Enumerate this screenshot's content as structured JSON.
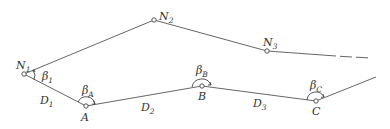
{
  "diagram": {
    "title": "",
    "points": {
      "N1": {
        "label": "N",
        "sub": "1",
        "x": 24,
        "y": 74
      },
      "N2": {
        "label": "N",
        "sub": "2",
        "x": 154,
        "y": 20
      },
      "N3": {
        "label": "N",
        "sub": "3",
        "x": 267,
        "y": 51
      },
      "A": {
        "label": "A",
        "x": 86,
        "y": 106
      },
      "B": {
        "label": "B",
        "x": 202,
        "y": 86
      },
      "C": {
        "label": "C",
        "x": 316,
        "y": 101
      }
    },
    "angles": {
      "b1": {
        "label": "β",
        "sub": "1"
      },
      "bA": {
        "label": "β",
        "sub": "A"
      },
      "bB": {
        "label": "β",
        "sub": "B"
      },
      "bC": {
        "label": "β",
        "sub": "C"
      }
    },
    "distances": {
      "D1": {
        "label": "D",
        "sub": "1"
      },
      "D2": {
        "label": "D",
        "sub": "2"
      },
      "D3": {
        "label": "D",
        "sub": "3"
      }
    },
    "colors": {
      "line": "#555555",
      "text": "#333333"
    }
  }
}
